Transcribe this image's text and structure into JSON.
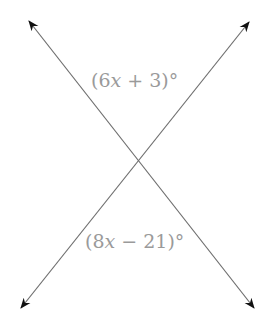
{
  "diagram": {
    "line_color": "#6e6e6e",
    "label_color": "#9a9a9a",
    "lines": [
      {
        "name": "line-1",
        "from": [
          29,
          21
        ],
        "to": [
          254,
          308
        ]
      },
      {
        "name": "line-2",
        "from": [
          249,
          22
        ],
        "to": [
          21,
          308
        ]
      }
    ],
    "intersection": [
      139,
      161
    ],
    "angles": {
      "top": {
        "open": "(",
        "coef": "6",
        "var": "x",
        "rest": " + 3)°"
      },
      "bottom": {
        "open": "(",
        "coef": "8",
        "var": "x",
        "rest": " − 21)°"
      }
    }
  }
}
